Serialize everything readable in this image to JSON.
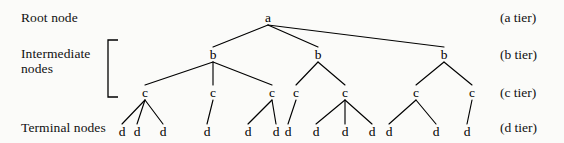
{
  "figure": {
    "width": 564,
    "height": 143,
    "background_color": "#fbfbf9",
    "line_color": "#000000",
    "text_color": "#111111"
  },
  "left_labels": {
    "root": "Root node",
    "intermediate": "Intermediate\nnodes",
    "intermediate_line1": "Intermediate",
    "intermediate_line2": "nodes",
    "terminal": "Terminal nodes"
  },
  "right_labels": {
    "a": "(a tier)",
    "b": "(b tier)",
    "c": "(c tier)",
    "d": "(d tier)"
  },
  "bracket": {
    "name": "intermediate-nodes-bracket",
    "x": 108,
    "top": 40,
    "bottom": 97,
    "arm": 10
  },
  "tiers": [
    {
      "id": "a",
      "label": "a",
      "y": 22
    },
    {
      "id": "b",
      "label": "b",
      "y": 59
    },
    {
      "id": "c",
      "label": "c",
      "y": 97
    },
    {
      "id": "d",
      "label": "d",
      "y": 136
    }
  ],
  "nodes": {
    "a": [
      {
        "id": "a1",
        "label": "a",
        "x": 268,
        "y": 22
      }
    ],
    "b": [
      {
        "id": "b1",
        "label": "b",
        "x": 213,
        "y": 59
      },
      {
        "id": "b2",
        "label": "b",
        "x": 318,
        "y": 59
      },
      {
        "id": "b3",
        "label": "b",
        "x": 444,
        "y": 59
      }
    ],
    "c": [
      {
        "id": "c1",
        "label": "c",
        "x": 145,
        "y": 97,
        "parent": "b1"
      },
      {
        "id": "c2",
        "label": "c",
        "x": 213,
        "y": 97,
        "parent": "b1"
      },
      {
        "id": "c3",
        "label": "c",
        "x": 272,
        "y": 97,
        "parent": "b1"
      },
      {
        "id": "c4",
        "label": "c",
        "x": 296,
        "y": 97,
        "parent": "b2"
      },
      {
        "id": "c5",
        "label": "c",
        "x": 345,
        "y": 97,
        "parent": "b2"
      },
      {
        "id": "c6",
        "label": "c",
        "x": 416,
        "y": 97,
        "parent": "b3"
      },
      {
        "id": "c7",
        "label": "c",
        "x": 472,
        "y": 97,
        "parent": "b3"
      }
    ],
    "d": [
      {
        "id": "d1",
        "label": "d",
        "x": 122,
        "y": 136,
        "parent": "c1"
      },
      {
        "id": "d2",
        "label": "d",
        "x": 137,
        "y": 136,
        "parent": "c1"
      },
      {
        "id": "d3",
        "label": "d",
        "x": 163,
        "y": 136,
        "parent": "c1"
      },
      {
        "id": "d4",
        "label": "d",
        "x": 207,
        "y": 136,
        "parent": "c2"
      },
      {
        "id": "d5",
        "label": "d",
        "x": 248,
        "y": 136,
        "parent": "c3"
      },
      {
        "id": "d6",
        "label": "d",
        "x": 276,
        "y": 136,
        "parent": "c3"
      },
      {
        "id": "d7",
        "label": "d",
        "x": 288,
        "y": 136,
        "parent": "c4"
      },
      {
        "id": "d8",
        "label": "d",
        "x": 316,
        "y": 136,
        "parent": "c5"
      },
      {
        "id": "d9",
        "label": "d",
        "x": 345,
        "y": 136,
        "parent": "c5"
      },
      {
        "id": "d10",
        "label": "d",
        "x": 372,
        "y": 136,
        "parent": "c5"
      },
      {
        "id": "d11",
        "label": "d",
        "x": 389,
        "y": 136,
        "parent": "c6"
      },
      {
        "id": "d12",
        "label": "d",
        "x": 436,
        "y": 136,
        "parent": "c6"
      },
      {
        "id": "d13",
        "label": "d",
        "x": 467,
        "y": 136,
        "parent": "c7"
      }
    ]
  },
  "edges": [
    {
      "from": "a1",
      "to": "b1"
    },
    {
      "from": "a1",
      "to": "b2"
    },
    {
      "from": "a1",
      "to": "b3"
    },
    {
      "from": "b1",
      "to": "c1"
    },
    {
      "from": "b1",
      "to": "c2"
    },
    {
      "from": "b1",
      "to": "c3"
    },
    {
      "from": "b2",
      "to": "c4"
    },
    {
      "from": "b2",
      "to": "c5"
    },
    {
      "from": "b3",
      "to": "c6"
    },
    {
      "from": "b3",
      "to": "c7"
    },
    {
      "from": "c1",
      "to": "d1"
    },
    {
      "from": "c1",
      "to": "d2"
    },
    {
      "from": "c1",
      "to": "d3"
    },
    {
      "from": "c2",
      "to": "d4"
    },
    {
      "from": "c3",
      "to": "d5"
    },
    {
      "from": "c3",
      "to": "d6"
    },
    {
      "from": "c4",
      "to": "d7"
    },
    {
      "from": "c5",
      "to": "d8"
    },
    {
      "from": "c5",
      "to": "d9"
    },
    {
      "from": "c5",
      "to": "d10"
    },
    {
      "from": "c6",
      "to": "d11"
    },
    {
      "from": "c6",
      "to": "d12"
    },
    {
      "from": "c7",
      "to": "d13"
    }
  ]
}
